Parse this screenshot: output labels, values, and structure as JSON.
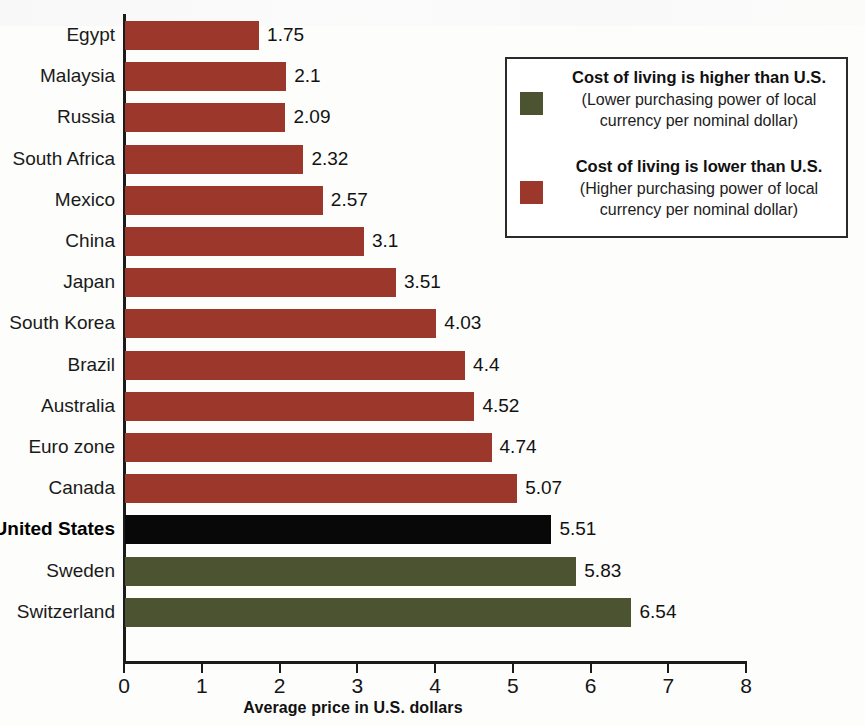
{
  "chart_data": {
    "type": "bar",
    "orientation": "horizontal",
    "title": "",
    "xlabel": "Average price in U.S. dollars",
    "ylabel": "",
    "xlim": [
      0,
      8
    ],
    "xticks": [
      "0",
      "1",
      "2",
      "3",
      "4",
      "5",
      "6",
      "7",
      "8"
    ],
    "grid": false,
    "categories": [
      "Egypt",
      "Malaysia",
      "Russia",
      "South Africa",
      "Mexico",
      "China",
      "Japan",
      "South Korea",
      "Brazil",
      "Australia",
      "Euro zone",
      "Canada",
      "United States",
      "Sweden",
      "Switzerland"
    ],
    "values": [
      1.75,
      2.1,
      2.09,
      2.32,
      2.57,
      3.1,
      3.51,
      4.03,
      4.4,
      4.52,
      4.74,
      5.07,
      5.51,
      5.83,
      6.54
    ],
    "value_labels": [
      "1.75",
      "2.1",
      "2.09",
      "2.32",
      "2.57",
      "3.1",
      "3.51",
      "4.03",
      "4.4",
      "4.52",
      "4.74",
      "5.07",
      "5.51",
      "5.83",
      "6.54"
    ],
    "bar_colors": [
      "red",
      "red",
      "red",
      "red",
      "red",
      "red",
      "red",
      "red",
      "red",
      "red",
      "red",
      "red",
      "black",
      "green",
      "green"
    ],
    "highlight_category": "United States",
    "colors": {
      "red": "#9c382b",
      "green": "#4c5331",
      "black": "#080808",
      "axis": "#1b1b1b",
      "background": "#fdfdfc"
    }
  },
  "legend": {
    "position": "top-right",
    "items": [
      {
        "swatch": "green",
        "heading": "Cost of living is higher than U.S.",
        "sub_line1": "(Lower purchasing power of local",
        "sub_line2": "currency per nominal dollar)"
      },
      {
        "swatch": "red",
        "heading": "Cost of living is lower than U.S.",
        "sub_line1": "(Higher purchasing power of local",
        "sub_line2": "currency per nominal dollar)"
      }
    ]
  }
}
